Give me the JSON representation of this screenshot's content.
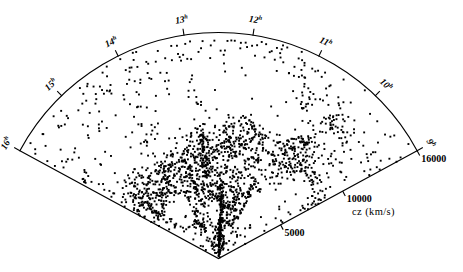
{
  "figure": {
    "type": "redshift-wedge-diagram",
    "background_color": "#ffffff",
    "ink_color": "#000000"
  },
  "axis": {
    "radial_title": "cz (km/s)",
    "radial_ticks": [
      {
        "label": "5000",
        "value": 5000
      },
      {
        "label": "10000",
        "value": 10000
      },
      {
        "label": "16000",
        "value": 16000
      }
    ]
  },
  "ra_axis": {
    "unit_superscript": "h",
    "ticks": [
      {
        "label": "16",
        "sup": "h",
        "hour": 16
      },
      {
        "label": "15",
        "sup": "h",
        "hour": 15
      },
      {
        "label": "14",
        "sup": "h",
        "hour": 14
      },
      {
        "label": "13",
        "sup": "h",
        "hour": 13
      },
      {
        "label": "12",
        "sup": "h",
        "hour": 12
      },
      {
        "label": "11",
        "sup": "h",
        "hour": 11
      },
      {
        "label": "10",
        "sup": "h",
        "hour": 10
      },
      {
        "label": "9",
        "sup": "h",
        "hour": 9
      }
    ]
  },
  "chart_data": {
    "type": "scatter",
    "title": "",
    "subtitle": "",
    "xlabel": "",
    "ylabel": "",
    "projection": "polar-wedge",
    "grid": false,
    "legend": null,
    "r_axis": {
      "name": "cz",
      "units": "km/s",
      "label": "cz (km/s)",
      "min": 0,
      "max": 16000,
      "ticks": [
        5000,
        10000,
        16000
      ],
      "tick_labels": [
        "5000",
        "10000",
        "16000"
      ]
    },
    "theta_axis": {
      "name": "Right Ascension",
      "units": "hours",
      "min": 9,
      "max": 16,
      "ticks": [
        9,
        10,
        11,
        12,
        13,
        14,
        15,
        16
      ],
      "tick_labels": [
        "9",
        "10",
        "11",
        "12",
        "13",
        "14",
        "15",
        "16"
      ]
    },
    "point_count": 1840,
    "marker": {
      "shape": "square",
      "size_px": 1.9,
      "color": "#000000"
    },
    "structures": [
      {
        "name": "Great Wall filament",
        "cz_range": [
          6500,
          9500
        ],
        "ra_range": [
          9,
          16
        ]
      },
      {
        "name": "Coma cluster finger-of-god",
        "ra": 12.95,
        "cz_range": [
          4500,
          10500
        ]
      },
      {
        "name": "foreground spike",
        "ra": 12.3,
        "cz_range": [
          500,
          3000
        ]
      },
      {
        "name": "void",
        "ra": 12.0,
        "cz_range": [
          10500,
          14500
        ]
      },
      {
        "name": "void",
        "ra": 14.7,
        "cz_range": [
          3000,
          5500
        ]
      }
    ]
  }
}
